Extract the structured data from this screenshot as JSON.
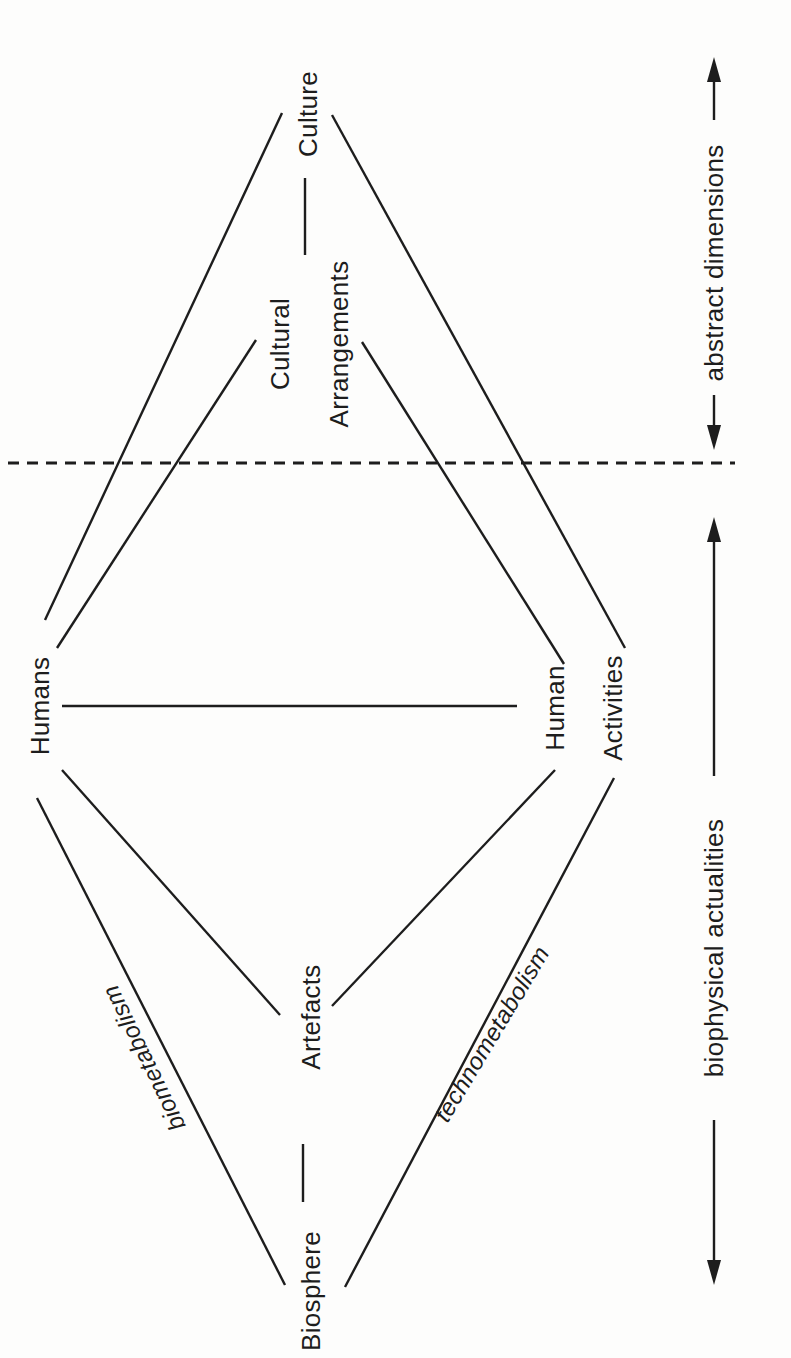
{
  "diagram": {
    "nodes": {
      "biosphere": {
        "label": "Biosphere"
      },
      "artefacts": {
        "label": "Artefacts"
      },
      "humans": {
        "label": "Humans"
      },
      "human_activities": {
        "line1": "Human",
        "line2": "Activities"
      },
      "cultural_arrangements": {
        "line1": "Cultural",
        "line2": "Arrangements"
      },
      "culture": {
        "label": "Culture"
      }
    },
    "edge_labels": {
      "biometabolism": "biometabolism",
      "technometabolism": "technometabolism"
    },
    "axis_labels": {
      "biophysical": "biophysical actualities",
      "abstract": "abstract dimensions"
    },
    "colors": {
      "ink": "#1d1d1d",
      "background": "#fdfdfc"
    }
  }
}
